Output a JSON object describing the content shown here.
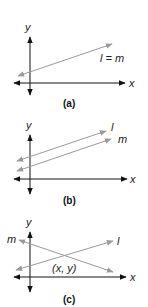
{
  "colors": {
    "axis": "#111111",
    "line": "#9a9a9a",
    "text": "#222222"
  },
  "panels": [
    {
      "caption": "(a)",
      "x_label": "x",
      "y_label": "y",
      "line_labels": [
        "l = m"
      ]
    },
    {
      "caption": "(b)",
      "x_label": "x",
      "y_label": "y",
      "line_labels": [
        "l",
        "m"
      ]
    },
    {
      "caption": "(c)",
      "x_label": "x",
      "y_label": "y",
      "line_labels": [
        "m",
        "l"
      ],
      "intersection_label": "(x, y)"
    }
  ]
}
